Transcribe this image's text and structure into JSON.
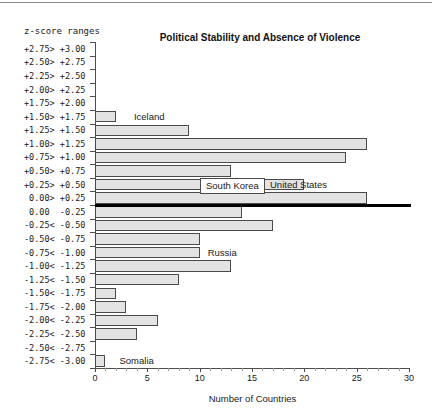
{
  "chart_data": {
    "type": "bar",
    "orientation": "horizontal",
    "title": "Political Stability and Absence of Violence",
    "xlabel": "Number of Countries",
    "ylabel": "z-score ranges",
    "xlim": [
      0,
      30
    ],
    "xticks": [
      0,
      5,
      10,
      15,
      20,
      25,
      30
    ],
    "xtick_labels": [
      "0",
      "5",
      "10",
      "15",
      "20",
      "25",
      "30"
    ],
    "grid": false,
    "legend": null,
    "categories": [
      "+2.75> +3.00",
      "+2.50> +2.75",
      "+2.25> +2.50",
      "+2.00> +2.25",
      "+1.75> +2.00",
      "+1.50> +1.75",
      "+1.25> +1.50",
      "+1.00> +1.25",
      "+0.75> +1.00",
      "+0.50> +0.75",
      "+0.25> +0.50",
      " 0.00> +0.25",
      " 0.00  -0.25",
      "-0.25< -0.50",
      "-0.50< -0.75",
      "-0.75< -1.00",
      "-1.00< -1.25",
      "-1.25< -1.50",
      "-1.50< -1.75",
      "-1.75< -2.00",
      "-2.00< -2.25",
      "-2.25< -2.50",
      "-2.50< -2.75",
      "-2.75< -3.00"
    ],
    "bins": [
      {
        "range": "+2.75 to +3.00",
        "value": 0
      },
      {
        "range": "+2.50 to +2.75",
        "value": 0
      },
      {
        "range": "+2.25 to +2.50",
        "value": 0
      },
      {
        "range": "+2.00 to +2.25",
        "value": 0
      },
      {
        "range": "+1.75 to +2.00",
        "value": 0
      },
      {
        "range": "+1.50 to +1.75",
        "value": 2
      },
      {
        "range": "+1.25 to +1.50",
        "value": 9
      },
      {
        "range": "+1.00 to +1.25",
        "value": 26
      },
      {
        "range": "+0.75 to +1.00",
        "value": 24
      },
      {
        "range": "+0.50 to +0.75",
        "value": 13
      },
      {
        "range": "+0.25 to +0.50",
        "value": 20
      },
      {
        "range": "0.00 to +0.25",
        "value": 26
      },
      {
        "range": "0.00 to -0.25",
        "value": 14
      },
      {
        "range": "-0.25 to -0.50",
        "value": 17
      },
      {
        "range": "-0.50 to -0.75",
        "value": 10
      },
      {
        "range": "-0.75 to -1.00",
        "value": 10
      },
      {
        "range": "-1.00 to -1.25",
        "value": 13
      },
      {
        "range": "-1.25 to -1.50",
        "value": 8
      },
      {
        "range": "-1.50 to -1.75",
        "value": 2
      },
      {
        "range": "-1.75 to -2.00",
        "value": 3
      },
      {
        "range": "-2.00 to -2.25",
        "value": 6
      },
      {
        "range": "-2.25 to -2.50",
        "value": 4
      },
      {
        "range": "-2.50 to -2.75",
        "value": 0
      },
      {
        "range": "-2.75 to -3.00",
        "value": 1
      }
    ],
    "values": [
      0,
      0,
      0,
      0,
      0,
      2,
      9,
      26,
      24,
      13,
      20,
      26,
      14,
      17,
      10,
      10,
      13,
      8,
      2,
      3,
      6,
      4,
      0,
      1
    ],
    "annotations": [
      {
        "label": "Iceland",
        "bin": "+1.50 to +1.75",
        "boxed": false
      },
      {
        "label": "South Korea",
        "bin": "+0.25 to +0.50",
        "boxed": true
      },
      {
        "label": "United States",
        "bin": "+0.25 to +0.50",
        "boxed": false
      },
      {
        "label": "Russia",
        "bin": "-0.75 to -1.00",
        "boxed": false
      },
      {
        "label": "Somalia",
        "bin": "-2.75 to -3.00",
        "boxed": false
      }
    ]
  },
  "colors": {
    "bar_fill": "#e3e3e3",
    "bar_stroke": "#4a4a4a",
    "zero_line": "#000000",
    "axis": "#4d4d4d",
    "text": "#1a1a1a"
  }
}
